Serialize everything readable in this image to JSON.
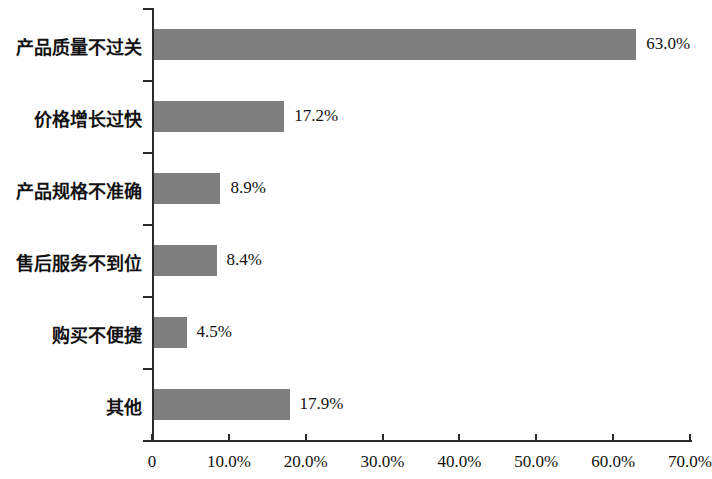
{
  "chart_data": {
    "type": "bar",
    "orientation": "horizontal",
    "title": "",
    "subtitle": "",
    "xlabel": "",
    "ylabel": "",
    "categories": [
      "产品质量不过关",
      "价格增长过快",
      "产品规格不准确",
      "售后服务不到位",
      "购买不便捷",
      "其他"
    ],
    "values": [
      63.0,
      17.2,
      8.9,
      8.4,
      4.5,
      17.9
    ],
    "value_labels": [
      "63.0%",
      "17.2%",
      "8.9%",
      "8.4%",
      "4.5%",
      "17.9%"
    ],
    "xlim": [
      0,
      70
    ],
    "xticks": [
      0,
      10,
      20,
      30,
      40,
      50,
      60,
      70
    ],
    "xtick_labels": [
      "0",
      "10.0%",
      "20.0%",
      "30.0%",
      "40.0%",
      "50.0%",
      "60.0%",
      "70.0%"
    ],
    "grid": false,
    "legend": null,
    "legend_position": "none",
    "bar_color": "#7f7f7f",
    "axis_color": "#2b2b2b",
    "text_color": "#111111",
    "background_color": "#ffffff"
  }
}
